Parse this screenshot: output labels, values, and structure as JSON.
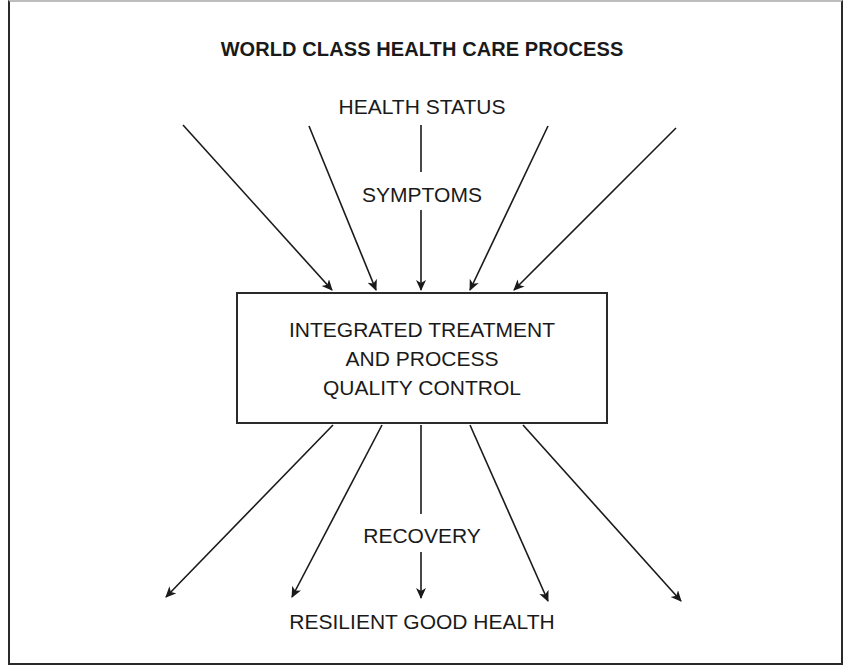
{
  "title": "WORLD CLASS HEALTH CARE PROCESS",
  "inputs": {
    "top_label": "HEALTH STATUS",
    "mid_label": "SYMPTOMS"
  },
  "process_box": {
    "lines": [
      "INTEGRATED TREATMENT",
      "AND PROCESS",
      "QUALITY CONTROL"
    ]
  },
  "outputs": {
    "mid_label": "RECOVERY",
    "bottom_label": "RESILIENT GOOD HEALTH"
  },
  "arrows": {
    "incoming_count": 5,
    "outgoing_count": 5
  }
}
